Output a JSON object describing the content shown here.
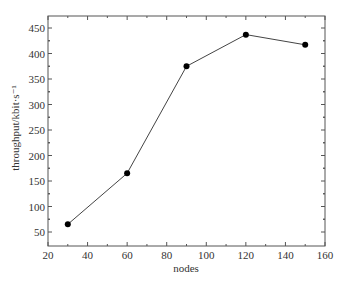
{
  "chart_data": {
    "type": "line",
    "title": "",
    "xlabel": "nodes",
    "ylabel": "throughput/kbit·s⁻¹",
    "x": [
      30,
      60,
      90,
      120,
      150
    ],
    "series": [
      {
        "name": "throughput",
        "values": [
          65,
          165,
          375,
          437,
          417
        ],
        "marker": "circle",
        "color": "#000000"
      }
    ],
    "xlim": [
      20,
      160
    ],
    "ylim": [
      25,
      475
    ],
    "xticks": [
      20,
      40,
      60,
      80,
      100,
      120,
      140,
      160
    ],
    "yticks": [
      50,
      100,
      150,
      200,
      250,
      300,
      350,
      400,
      450
    ],
    "grid": false,
    "legend": null
  },
  "colors": {
    "line": "#444444",
    "marker": "#000000",
    "axis": "#555555",
    "text": "#333333"
  }
}
